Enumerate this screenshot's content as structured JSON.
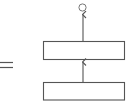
{
  "diagram": {
    "equals_symbol": "=",
    "colors": {
      "stroke": "#555555",
      "background": "#ffffff"
    },
    "nodes": [
      {
        "id": "output-circle",
        "shape": "circle",
        "label": ""
      },
      {
        "id": "upper-box",
        "shape": "rectangle",
        "label": ""
      },
      {
        "id": "lower-box",
        "shape": "rectangle",
        "label": ""
      }
    ],
    "edges": [
      {
        "from": "lower-box",
        "to": "upper-box",
        "direction": "up"
      },
      {
        "from": "upper-box",
        "to": "output-circle",
        "direction": "up"
      }
    ]
  }
}
